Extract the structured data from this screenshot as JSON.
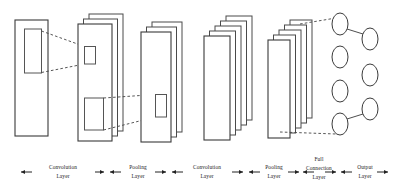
{
  "figure": {
    "background_color": "#ffffff",
    "stroke_color": "#3a3a3a",
    "connector_style": "dashed"
  },
  "stages": [
    {
      "id": "input",
      "kind": "input-image",
      "plane_count": 1,
      "inner_box_count": 1,
      "x": 15,
      "y": 20,
      "w": 33,
      "h": 116
    },
    {
      "id": "conv1",
      "kind": "feature-map-stack",
      "plane_count": 3,
      "inner_box_count": 2,
      "x": 78,
      "y": 24,
      "w": 34,
      "h": 117
    },
    {
      "id": "pool1",
      "kind": "feature-map-stack",
      "plane_count": 3,
      "inner_box_count": 1,
      "x": 141,
      "y": 32,
      "w": 30,
      "h": 110
    },
    {
      "id": "conv2",
      "kind": "feature-map-stack",
      "plane_count": 5,
      "inner_box_count": 0,
      "x": 204,
      "y": 36,
      "w": 26,
      "h": 104
    },
    {
      "id": "pool2",
      "kind": "feature-map-stack",
      "plane_count": 5,
      "inner_box_count": 0,
      "x": 268,
      "y": 40,
      "w": 22,
      "h": 98
    },
    {
      "id": "fc",
      "kind": "dense-stack",
      "plane_count": 5,
      "inner_box_count": 0,
      "x": 282,
      "y": 42,
      "w": 16,
      "h": 94
    },
    {
      "id": "output",
      "kind": "node-columns",
      "columns": [
        {
          "node_count": 4
        },
        {
          "node_count": 3
        }
      ]
    }
  ],
  "axis": {
    "arrow_left": "←",
    "arrow_right": "→",
    "labels": [
      {
        "id": "conv-1",
        "lines": [
          "Convolution",
          "Layer"
        ]
      },
      {
        "id": "pool-1",
        "lines": [
          "Pooling",
          "Layer"
        ]
      },
      {
        "id": "conv-2",
        "lines": [
          "Convolution",
          "Layer"
        ]
      },
      {
        "id": "pool-2",
        "lines": [
          "Pooling",
          "Layer"
        ]
      },
      {
        "id": "full-connection",
        "lines": [
          "Full",
          "Connection",
          "Layer"
        ]
      },
      {
        "id": "output",
        "lines": [
          "Output",
          "Layer"
        ]
      }
    ]
  }
}
